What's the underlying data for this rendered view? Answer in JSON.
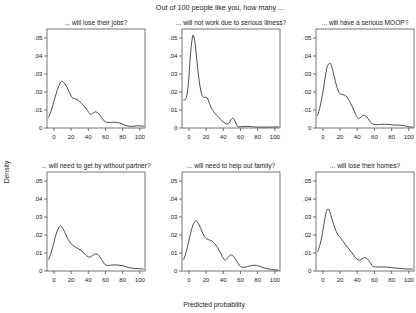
{
  "chart_data": {
    "type": "line",
    "title": "Out of 100 people like you, how many ...",
    "xlabel": "Predicted probability",
    "ylabel": "Density",
    "xlim": [
      -8,
      106
    ],
    "ylim": [
      0,
      0.055
    ],
    "xticks": [
      0,
      20,
      40,
      60,
      80,
      100
    ],
    "xtick_labels": [
      "0",
      "20",
      "40",
      "60",
      "80",
      "100"
    ],
    "yticks": [
      0,
      0.01,
      0.02,
      0.03,
      0.04,
      0.05
    ],
    "ytick_labels": [
      "0",
      ".01",
      ".02",
      ".03",
      ".04",
      ".05"
    ],
    "grid": false,
    "legend": "none",
    "layout": {
      "rows": 2,
      "cols": 3
    },
    "line_color": "#2a2a2a",
    "panels": [
      {
        "id": "jobs",
        "title": "... will lose their jobs?",
        "row": 0,
        "col": 0,
        "x": [
          -6,
          -3,
          0,
          3,
          6,
          9,
          12,
          15,
          18,
          21,
          24,
          27,
          30,
          33,
          36,
          39,
          42,
          45,
          48,
          51,
          54,
          57,
          60,
          63,
          66,
          69,
          72,
          75,
          78,
          81,
          84,
          87,
          90,
          93,
          96,
          99,
          102,
          104
        ],
        "y": [
          0.006,
          0.0098,
          0.0148,
          0.0196,
          0.0238,
          0.0259,
          0.0251,
          0.0228,
          0.0199,
          0.017,
          0.0163,
          0.0158,
          0.0147,
          0.0133,
          0.0117,
          0.0098,
          0.0077,
          0.0081,
          0.009,
          0.0084,
          0.0068,
          0.0048,
          0.0033,
          0.0031,
          0.0031,
          0.0032,
          0.0031,
          0.0029,
          0.0026,
          0.0019,
          0.0013,
          0.001,
          0.0009,
          0.001,
          0.0012,
          0.0012,
          0.0011,
          0.001
        ]
      },
      {
        "id": "illness",
        "title": "... will not work due to serious illness?",
        "row": 0,
        "col": 1,
        "x": [
          -6,
          -4,
          -2,
          0,
          2,
          4,
          5,
          7,
          9,
          11,
          13,
          15,
          17,
          19,
          21,
          23,
          25,
          27,
          29,
          32,
          35,
          38,
          41,
          44,
          47,
          49,
          51,
          53,
          55,
          57,
          60,
          64,
          68,
          72,
          76,
          80,
          85,
          90,
          95,
          100,
          104
        ],
        "y": [
          0.0155,
          0.016,
          0.019,
          0.028,
          0.042,
          0.05,
          0.0515,
          0.048,
          0.039,
          0.03,
          0.023,
          0.0185,
          0.017,
          0.0172,
          0.0168,
          0.015,
          0.0122,
          0.0104,
          0.009,
          0.0073,
          0.0058,
          0.0042,
          0.003,
          0.0023,
          0.0029,
          0.0046,
          0.0055,
          0.0045,
          0.0022,
          0.0008,
          0.0007,
          0.0009,
          0.0009,
          0.0008,
          0.0006,
          0.0005,
          0.0005,
          0.0005,
          0.0005,
          0.0006,
          0.0006
        ]
      },
      {
        "id": "moop",
        "title": "... will have a serious MOOP?",
        "row": 0,
        "col": 2,
        "x": [
          -6,
          -3,
          0,
          3,
          5,
          8,
          10,
          13,
          16,
          19,
          22,
          25,
          28,
          31,
          34,
          37,
          40,
          43,
          46,
          49,
          52,
          55,
          58,
          61,
          65,
          69,
          73,
          77,
          81,
          85,
          89,
          93,
          97,
          101,
          104
        ],
        "y": [
          0.007,
          0.0125,
          0.02,
          0.029,
          0.034,
          0.036,
          0.0345,
          0.029,
          0.0232,
          0.0196,
          0.0186,
          0.0184,
          0.0172,
          0.0148,
          0.012,
          0.0088,
          0.0058,
          0.0055,
          0.0068,
          0.007,
          0.0054,
          0.0035,
          0.0023,
          0.0019,
          0.0019,
          0.0021,
          0.0021,
          0.0019,
          0.0017,
          0.0016,
          0.0016,
          0.0014,
          0.001,
          0.0006,
          0.0005
        ]
      },
      {
        "id": "partner",
        "title": "... will need to get by without partner?",
        "row": 1,
        "col": 0,
        "x": [
          -6,
          -3,
          0,
          3,
          6,
          8,
          11,
          14,
          17,
          20,
          23,
          26,
          29,
          32,
          35,
          38,
          41,
          44,
          47,
          50,
          53,
          56,
          59,
          62,
          66,
          70,
          74,
          78,
          82,
          86,
          90,
          94,
          98,
          102,
          104
        ],
        "y": [
          0.0065,
          0.0105,
          0.0158,
          0.021,
          0.0244,
          0.025,
          0.0232,
          0.0201,
          0.0172,
          0.0152,
          0.014,
          0.0131,
          0.0122,
          0.0112,
          0.0099,
          0.0085,
          0.0077,
          0.0082,
          0.0093,
          0.0095,
          0.0083,
          0.006,
          0.0038,
          0.0031,
          0.0032,
          0.0034,
          0.0033,
          0.0031,
          0.0027,
          0.0021,
          0.0016,
          0.0014,
          0.0013,
          0.0012,
          0.0011
        ]
      },
      {
        "id": "family",
        "title": "... will need to help out family?",
        "row": 1,
        "col": 1,
        "x": [
          -6,
          -3,
          0,
          3,
          6,
          9,
          12,
          15,
          18,
          21,
          24,
          27,
          30,
          33,
          36,
          39,
          42,
          45,
          48,
          51,
          54,
          57,
          60,
          63,
          67,
          71,
          74,
          77,
          80,
          84,
          88,
          92,
          96,
          100,
          104
        ],
        "y": [
          0.0065,
          0.0108,
          0.0168,
          0.0228,
          0.0268,
          0.0276,
          0.0256,
          0.0222,
          0.0192,
          0.0178,
          0.0172,
          0.0166,
          0.0152,
          0.0132,
          0.0108,
          0.008,
          0.006,
          0.0072,
          0.0088,
          0.0086,
          0.0068,
          0.0044,
          0.0024,
          0.0021,
          0.0023,
          0.0028,
          0.0031,
          0.0032,
          0.003,
          0.0023,
          0.0016,
          0.0012,
          0.0009,
          0.0006,
          0.0005
        ]
      },
      {
        "id": "homes",
        "title": "... will lose their homes?",
        "row": 1,
        "col": 2,
        "x": [
          -6,
          -4,
          -1,
          2,
          4,
          6,
          8,
          11,
          14,
          17,
          20,
          23,
          26,
          29,
          32,
          35,
          38,
          41,
          44,
          47,
          50,
          53,
          56,
          58,
          61,
          65,
          70,
          75,
          80,
          85,
          90,
          95,
          100,
          104
        ],
        "y": [
          0.011,
          0.0135,
          0.0195,
          0.0282,
          0.033,
          0.0345,
          0.033,
          0.0282,
          0.0238,
          0.0205,
          0.0188,
          0.0168,
          0.0148,
          0.013,
          0.0112,
          0.0094,
          0.0074,
          0.0062,
          0.0062,
          0.0072,
          0.0073,
          0.006,
          0.004,
          0.0026,
          0.0023,
          0.0022,
          0.0022,
          0.0021,
          0.0019,
          0.0016,
          0.0014,
          0.0012,
          0.0011,
          0.0011
        ]
      }
    ]
  }
}
